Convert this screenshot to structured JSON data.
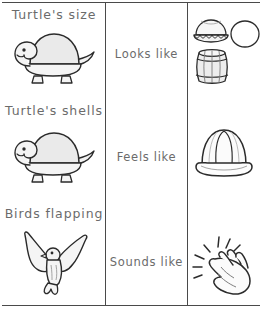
{
  "worksheet": {
    "title": "Sensory description matching worksheet",
    "columns": [
      {
        "name": "subject",
        "header": ""
      },
      {
        "name": "sense",
        "header": ""
      },
      {
        "name": "image",
        "header": ""
      }
    ],
    "rows": [
      {
        "subject_text": "Turtle's size",
        "subject_icon": "turtle-icon",
        "sense_text": "Looks like",
        "image_icons": [
          "pie-icon",
          "circle-icon",
          "barrel-icon"
        ]
      },
      {
        "subject_text": "Turtle's shells",
        "subject_icon": "turtle-icon",
        "sense_text": "Feels like",
        "image_icons": [
          "hard-hat-icon"
        ]
      },
      {
        "subject_text": "Birds  flapping",
        "subject_icon": "bird-icon",
        "sense_text": "Sounds like",
        "image_icons": [
          "clapping-hands-icon"
        ]
      }
    ]
  },
  "colors": {
    "line": "#4a4a4a",
    "text": "#6b6b6b",
    "art_stroke": "#2b2b2b",
    "art_fill": "#f2f2f2",
    "art_fill_shade": "#e3e3e3",
    "page_background": "#ffffff"
  }
}
